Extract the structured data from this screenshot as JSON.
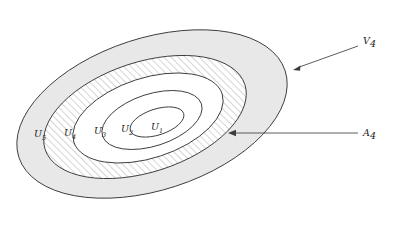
{
  "figure": {
    "type": "nested-ellipse-diagram",
    "background_color": "#ffffff",
    "outline_color": "#3c3c3c",
    "shade_color": "#e8e8e8",
    "hatch_color": "#8a8a8a",
    "leader_color": "#4a4a4a",
    "rotation_degrees": -18
  },
  "regions": [
    {
      "id": "U1",
      "label": "U",
      "subscript": "1",
      "label_x": 156,
      "label_y": 130,
      "fill": "white",
      "rx": 28,
      "ry": 13,
      "cx": 157,
      "cy": 122
    },
    {
      "id": "U2",
      "label": "U",
      "subscript": "2",
      "label_x": 126,
      "label_y": 132,
      "fill": "white",
      "rx": 52,
      "ry": 26,
      "cx": 152,
      "cy": 120
    },
    {
      "id": "U3",
      "label": "U",
      "subscript": "3",
      "label_x": 100,
      "label_y": 134,
      "fill": "white",
      "rx": 78,
      "ry": 40,
      "cx": 148,
      "cy": 118
    },
    {
      "id": "U4",
      "label": "U",
      "subscript": "4",
      "label_x": 70,
      "label_y": 136,
      "fill": "hatched",
      "rx": 105,
      "ry": 55,
      "cx": 145,
      "cy": 117
    },
    {
      "id": "U5",
      "label": "U",
      "subscript": "5",
      "label_x": 40,
      "label_y": 137,
      "fill": "shaded",
      "rx": 140,
      "ry": 76,
      "cx": 152,
      "cy": 114
    }
  ],
  "callouts": [
    {
      "id": "V4",
      "label": "V",
      "subscript": "4",
      "label_x": 365,
      "label_y": 44,
      "line_x1": 358,
      "line_y1": 46,
      "line_x2": 297,
      "line_y2": 68,
      "arrow_x": 293,
      "arrow_y": 70,
      "arrow_angle": 200
    },
    {
      "id": "A4",
      "label": "A",
      "subscript": "4",
      "label_x": 365,
      "label_y": 136,
      "line_x1": 358,
      "line_y1": 133,
      "line_x2": 234,
      "line_y2": 133,
      "arrow_x": 228,
      "arrow_y": 133,
      "arrow_angle": 180
    }
  ]
}
